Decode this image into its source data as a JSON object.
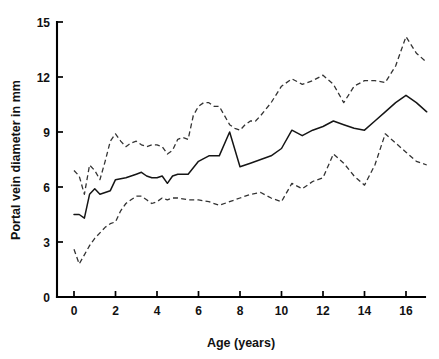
{
  "chart_data": {
    "type": "line",
    "title": "",
    "subtitle": "",
    "xlabel": "Age (years)",
    "ylabel": "Portal vein diameter in mm",
    "xlim": [
      -0.5,
      17.2
    ],
    "ylim": [
      0,
      15
    ],
    "xticks": [
      0,
      2,
      4,
      6,
      8,
      10,
      12,
      14,
      16
    ],
    "xticklabels": [
      "0",
      "2",
      "4",
      "6",
      "8",
      "10",
      "12",
      "14",
      "16"
    ],
    "yticks": [
      0,
      3,
      6,
      9,
      12,
      15
    ],
    "yticklabels": [
      "0",
      "3",
      "6",
      "9",
      "12",
      "15"
    ],
    "grid": false,
    "legend": false,
    "legend_position": "none",
    "line_color": "#151515",
    "band_color": "#333333",
    "background_color": "#ffffff",
    "annotations": [],
    "series": [
      {
        "name": "Upper percentile",
        "style": "dashed",
        "x": [
          0.0,
          0.25,
          0.5,
          0.75,
          1.0,
          1.25,
          1.5,
          1.75,
          2.0,
          2.25,
          2.5,
          2.75,
          3.0,
          3.25,
          3.5,
          3.75,
          4.0,
          4.25,
          4.5,
          4.75,
          5.0,
          5.25,
          5.5,
          5.75,
          6.0,
          6.25,
          6.5,
          6.75,
          7.0,
          7.25,
          7.5,
          7.75,
          8.0,
          8.25,
          8.5,
          8.75,
          9.0,
          9.5,
          10.0,
          10.5,
          11.0,
          11.5,
          12.0,
          12.5,
          13.0,
          13.5,
          14.0,
          14.5,
          15.0,
          15.5,
          16.0,
          16.5,
          17.0
        ],
        "y": [
          6.9,
          6.6,
          5.6,
          7.2,
          6.9,
          6.4,
          7.4,
          8.5,
          8.9,
          8.5,
          8.2,
          8.4,
          8.5,
          8.3,
          8.2,
          8.3,
          8.3,
          8.2,
          7.8,
          8.0,
          8.6,
          8.7,
          8.6,
          9.9,
          10.4,
          10.6,
          10.6,
          10.4,
          10.4,
          9.9,
          9.4,
          9.2,
          9.1,
          9.4,
          9.6,
          9.6,
          9.9,
          10.6,
          11.5,
          11.9,
          11.6,
          11.8,
          12.1,
          11.6,
          10.6,
          11.5,
          11.8,
          11.8,
          11.7,
          12.6,
          14.2,
          13.3,
          12.8
        ]
      },
      {
        "name": "Median",
        "style": "solid",
        "x": [
          0.0,
          0.25,
          0.5,
          0.75,
          1.0,
          1.25,
          1.5,
          1.75,
          2.0,
          2.5,
          3.0,
          3.25,
          3.5,
          3.75,
          4.0,
          4.25,
          4.5,
          4.75,
          5.0,
          5.5,
          6.0,
          6.5,
          7.0,
          7.5,
          8.0,
          8.5,
          9.0,
          9.5,
          10.0,
          10.5,
          11.0,
          11.5,
          12.0,
          12.5,
          13.0,
          13.5,
          14.0,
          14.5,
          15.0,
          15.5,
          16.0,
          16.5,
          17.0
        ],
        "y": [
          4.5,
          4.5,
          4.3,
          5.6,
          5.9,
          5.6,
          5.7,
          5.8,
          6.4,
          6.5,
          6.7,
          6.8,
          6.6,
          6.5,
          6.5,
          6.6,
          6.2,
          6.6,
          6.7,
          6.7,
          7.4,
          7.7,
          7.7,
          9.0,
          7.1,
          7.3,
          7.5,
          7.7,
          8.1,
          9.1,
          8.8,
          9.1,
          9.3,
          9.6,
          9.4,
          9.2,
          9.1,
          9.6,
          10.1,
          10.6,
          11.0,
          10.6,
          10.1
        ]
      },
      {
        "name": "Lower percentile",
        "style": "dashed",
        "x": [
          0.0,
          0.25,
          0.5,
          0.75,
          1.0,
          1.25,
          1.5,
          1.75,
          2.0,
          2.25,
          2.5,
          2.75,
          3.0,
          3.25,
          3.5,
          3.75,
          4.0,
          4.25,
          4.5,
          4.75,
          5.0,
          5.5,
          6.0,
          6.5,
          7.0,
          7.5,
          8.0,
          8.5,
          9.0,
          9.5,
          10.0,
          10.5,
          11.0,
          11.5,
          12.0,
          12.5,
          13.0,
          13.5,
          14.0,
          14.5,
          15.0,
          15.5,
          16.0,
          16.5,
          17.0
        ],
        "y": [
          2.6,
          1.8,
          2.3,
          2.8,
          3.2,
          3.5,
          3.8,
          4.0,
          4.1,
          4.7,
          5.1,
          5.3,
          5.5,
          5.5,
          5.3,
          5.1,
          5.2,
          5.4,
          5.3,
          5.4,
          5.4,
          5.3,
          5.3,
          5.2,
          5.0,
          5.2,
          5.4,
          5.6,
          5.7,
          5.4,
          5.2,
          6.2,
          5.9,
          6.3,
          6.5,
          7.8,
          7.3,
          6.6,
          6.1,
          7.2,
          8.9,
          8.4,
          7.9,
          7.4,
          7.2
        ]
      }
    ]
  }
}
